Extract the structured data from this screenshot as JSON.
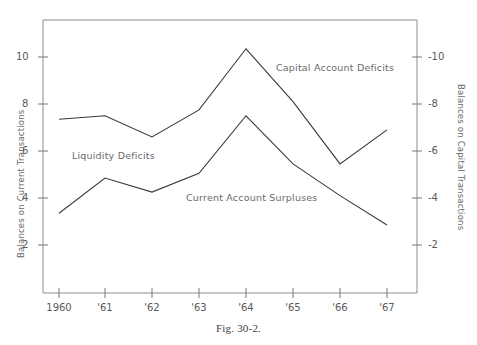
{
  "figure": {
    "caption": "Fig. 30-2.",
    "left_axis_title": "Balances on Current Transactions",
    "right_axis_title": "Balances on Capital Transactions"
  },
  "chart_data": {
    "type": "line",
    "title": "",
    "xlabel": "",
    "ylabel": "Balances on Current Transactions",
    "y2label": "Balances on Capital Transactions",
    "categories": [
      "1960",
      "'61",
      "'62",
      "'63",
      "'64",
      "'65",
      "'66",
      "'67"
    ],
    "x_tick_labels": [
      "1960",
      "'61",
      "'62",
      "'63",
      "'64",
      "'65",
      "'66",
      "'67"
    ],
    "y_tick_labels": [
      "2",
      "4",
      "6",
      "8",
      "10"
    ],
    "y_tick_values": [
      2,
      4,
      6,
      8,
      10
    ],
    "y2_tick_labels": [
      "-2",
      "-4",
      "-6",
      "-8",
      "-10"
    ],
    "y2_tick_values": [
      -2,
      -4,
      -6,
      -8,
      -10
    ],
    "ylim": [
      0,
      11.6
    ],
    "grid": false,
    "legend": "inline-annotations",
    "series": [
      {
        "name": "Capital Account Deficits",
        "annotation": "Capital Account Deficits",
        "values": [
          7.35,
          7.5,
          6.6,
          7.75,
          10.35,
          8.1,
          5.45,
          6.9
        ]
      },
      {
        "name": "Current Account Surpluses",
        "annotation": "Current Account Surpluses",
        "values": [
          3.35,
          4.85,
          4.25,
          5.05,
          7.5,
          5.45,
          4.1,
          2.85
        ]
      }
    ],
    "annotations": [
      {
        "text": "Capital Account Deficits",
        "x": 276,
        "y": 69
      },
      {
        "text": "Liquidity Deficits",
        "x": 72,
        "y": 157
      },
      {
        "text": "Current Account Surpluses",
        "x": 186,
        "y": 199
      }
    ]
  }
}
